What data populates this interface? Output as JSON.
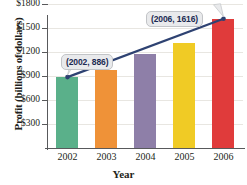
{
  "chart_data": {
    "type": "bar",
    "title": "",
    "xlabel": "Year",
    "ylabel": "Profit (billions of dollars)",
    "categories": [
      "2002",
      "2003",
      "2004",
      "2005",
      "2006"
    ],
    "values": [
      886,
      980,
      1180,
      1315,
      1616
    ],
    "ylim": [
      0,
      1800
    ],
    "yticks": [
      300,
      600,
      900,
      1200,
      1500,
      1800
    ],
    "ytick_labels": [
      "$300",
      "$600",
      "$900",
      "$1200",
      "$1500",
      "$1800"
    ],
    "grid": true,
    "legend": "none",
    "bar_colors": [
      "#5ab08a",
      "#ef9238",
      "#8e7fa8",
      "#f0cb25",
      "#e03b3b"
    ],
    "annotations": [
      {
        "label": "(2002, 886)",
        "x": "2002",
        "y": 886
      },
      {
        "label": "(2006, 1616)",
        "x": "2006",
        "y": 1616
      }
    ],
    "overlay_series": {
      "name": "trend-line",
      "color": "#2e4272",
      "points": [
        {
          "x": "2002",
          "y": 886
        },
        {
          "x": "2006",
          "y": 1616
        }
      ]
    }
  }
}
